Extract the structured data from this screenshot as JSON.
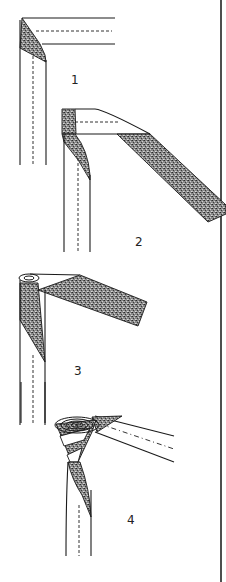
{
  "figure": {
    "steps": [
      {
        "number": "1",
        "label_x": 74,
        "label_y": 84
      },
      {
        "number": "2",
        "label_x": 139,
        "label_y": 246
      },
      {
        "number": "3",
        "label_x": 78,
        "label_y": 375
      },
      {
        "number": "4",
        "label_x": 131,
        "label_y": 524
      }
    ],
    "colors": {
      "line": "#1a1a1a",
      "shading_dark": "#3a3a3a",
      "shading_light": "#bdbdbd",
      "background": "#ffffff"
    },
    "border": {
      "x": 221,
      "y1": 0,
      "y2": 582
    }
  }
}
